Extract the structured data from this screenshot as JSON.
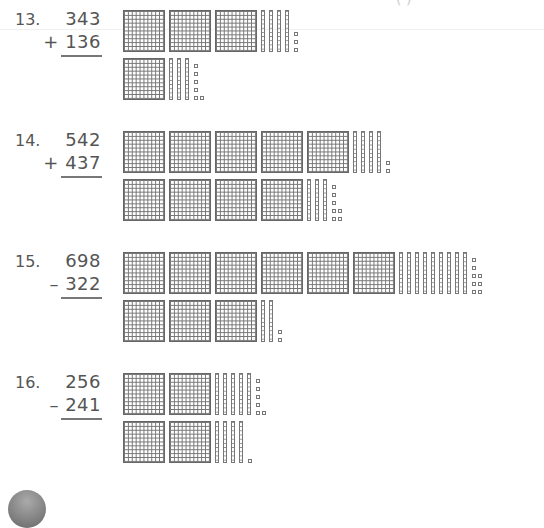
{
  "header_fragment": "( )",
  "problems": [
    {
      "number": "13.",
      "top": "343",
      "bottom": "+ 136",
      "operation": "add",
      "model_top": {
        "hundreds": 3,
        "tens": 4,
        "ones": 3
      },
      "model_bottom": {
        "hundreds": 1,
        "tens": 3,
        "ones": 6
      }
    },
    {
      "number": "14.",
      "top": "542",
      "bottom": "+ 437",
      "operation": "add",
      "model_top": {
        "hundreds": 5,
        "tens": 4,
        "ones": 2
      },
      "model_bottom": {
        "hundreds": 4,
        "tens": 3,
        "ones": 7
      }
    },
    {
      "number": "15.",
      "top": "698",
      "bottom": "– 322",
      "operation": "subtract",
      "model_top": {
        "hundreds": 6,
        "tens": 9,
        "ones": 8
      },
      "model_bottom": {
        "hundreds": 3,
        "tens": 2,
        "ones": 2
      }
    },
    {
      "number": "16.",
      "top": "256",
      "bottom": "– 241",
      "operation": "subtract",
      "model_top": {
        "hundreds": 2,
        "tens": 5,
        "ones": 6
      },
      "model_bottom": {
        "hundreds": 2,
        "tens": 4,
        "ones": 1
      }
    }
  ]
}
